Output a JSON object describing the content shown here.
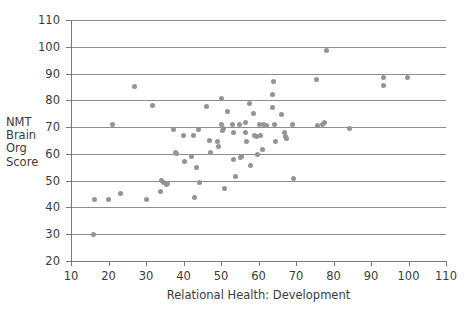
{
  "chart_data": {
    "type": "scatter",
    "title": "",
    "xlabel": "Relational Health: Development",
    "ylabel": "NMT Brain Org Score",
    "ylabel_lines": [
      "NMT",
      "Brain",
      "Org",
      "Score"
    ],
    "xlim": [
      10,
      110
    ],
    "ylim": [
      20,
      110
    ],
    "xticks": [
      10,
      20,
      30,
      40,
      50,
      60,
      70,
      80,
      90,
      100,
      110
    ],
    "yticks": [
      20,
      30,
      40,
      50,
      60,
      70,
      80,
      90,
      100,
      110
    ],
    "grid": "horizontal",
    "legend": "none",
    "marker_color": "#949494",
    "marker_size_px": 5,
    "points": [
      {
        "x": 16.0,
        "y": 29.8
      },
      {
        "x": 16.2,
        "y": 43.0
      },
      {
        "x": 20.0,
        "y": 42.9
      },
      {
        "x": 21.0,
        "y": 70.8
      },
      {
        "x": 23.2,
        "y": 45.3
      },
      {
        "x": 27.0,
        "y": 85.0
      },
      {
        "x": 30.0,
        "y": 43.0
      },
      {
        "x": 31.8,
        "y": 77.9
      },
      {
        "x": 33.8,
        "y": 45.8
      },
      {
        "x": 34.2,
        "y": 50.0
      },
      {
        "x": 34.6,
        "y": 49.3
      },
      {
        "x": 35.4,
        "y": 48.4
      },
      {
        "x": 35.8,
        "y": 49.1
      },
      {
        "x": 37.4,
        "y": 69.0
      },
      {
        "x": 37.8,
        "y": 60.4
      },
      {
        "x": 38.2,
        "y": 60.2
      },
      {
        "x": 40.0,
        "y": 66.9
      },
      {
        "x": 40.2,
        "y": 57.0
      },
      {
        "x": 42.0,
        "y": 59.1
      },
      {
        "x": 42.6,
        "y": 66.7
      },
      {
        "x": 43.0,
        "y": 43.8
      },
      {
        "x": 43.4,
        "y": 55.0
      },
      {
        "x": 44.0,
        "y": 69.1
      },
      {
        "x": 44.2,
        "y": 49.2
      },
      {
        "x": 46.0,
        "y": 77.8
      },
      {
        "x": 46.8,
        "y": 64.9
      },
      {
        "x": 47.2,
        "y": 60.7
      },
      {
        "x": 49.0,
        "y": 64.8
      },
      {
        "x": 49.4,
        "y": 62.9
      },
      {
        "x": 50.0,
        "y": 80.7
      },
      {
        "x": 50.2,
        "y": 71.0
      },
      {
        "x": 50.4,
        "y": 68.6
      },
      {
        "x": 50.6,
        "y": 69.6
      },
      {
        "x": 50.8,
        "y": 47.0
      },
      {
        "x": 51.6,
        "y": 76.0
      },
      {
        "x": 53.0,
        "y": 70.9
      },
      {
        "x": 53.2,
        "y": 68.0
      },
      {
        "x": 53.4,
        "y": 57.8
      },
      {
        "x": 53.8,
        "y": 51.7
      },
      {
        "x": 55.0,
        "y": 71.0
      },
      {
        "x": 55.2,
        "y": 58.8
      },
      {
        "x": 55.4,
        "y": 59.0
      },
      {
        "x": 56.4,
        "y": 71.8
      },
      {
        "x": 56.6,
        "y": 68.1
      },
      {
        "x": 56.8,
        "y": 64.8
      },
      {
        "x": 57.6,
        "y": 79.0
      },
      {
        "x": 57.8,
        "y": 55.7
      },
      {
        "x": 58.6,
        "y": 75.0
      },
      {
        "x": 59.0,
        "y": 67.0
      },
      {
        "x": 59.4,
        "y": 66.6
      },
      {
        "x": 59.6,
        "y": 59.7
      },
      {
        "x": 60.2,
        "y": 70.9
      },
      {
        "x": 60.6,
        "y": 66.9
      },
      {
        "x": 61.0,
        "y": 61.6
      },
      {
        "x": 61.4,
        "y": 70.8
      },
      {
        "x": 62.0,
        "y": 70.7
      },
      {
        "x": 63.6,
        "y": 82.0
      },
      {
        "x": 63.8,
        "y": 77.2
      },
      {
        "x": 64.0,
        "y": 87.0
      },
      {
        "x": 64.2,
        "y": 70.9
      },
      {
        "x": 64.4,
        "y": 64.6
      },
      {
        "x": 66.2,
        "y": 74.8
      },
      {
        "x": 67.0,
        "y": 68.0
      },
      {
        "x": 67.2,
        "y": 66.6
      },
      {
        "x": 67.4,
        "y": 65.7
      },
      {
        "x": 69.0,
        "y": 70.8
      },
      {
        "x": 69.2,
        "y": 50.9
      },
      {
        "x": 75.4,
        "y": 87.6
      },
      {
        "x": 75.8,
        "y": 70.6
      },
      {
        "x": 77.0,
        "y": 70.9
      },
      {
        "x": 77.6,
        "y": 71.7
      },
      {
        "x": 78.0,
        "y": 98.6
      },
      {
        "x": 84.2,
        "y": 69.5
      },
      {
        "x": 93.2,
        "y": 88.7
      },
      {
        "x": 93.4,
        "y": 85.6
      },
      {
        "x": 99.6,
        "y": 88.5
      }
    ]
  }
}
